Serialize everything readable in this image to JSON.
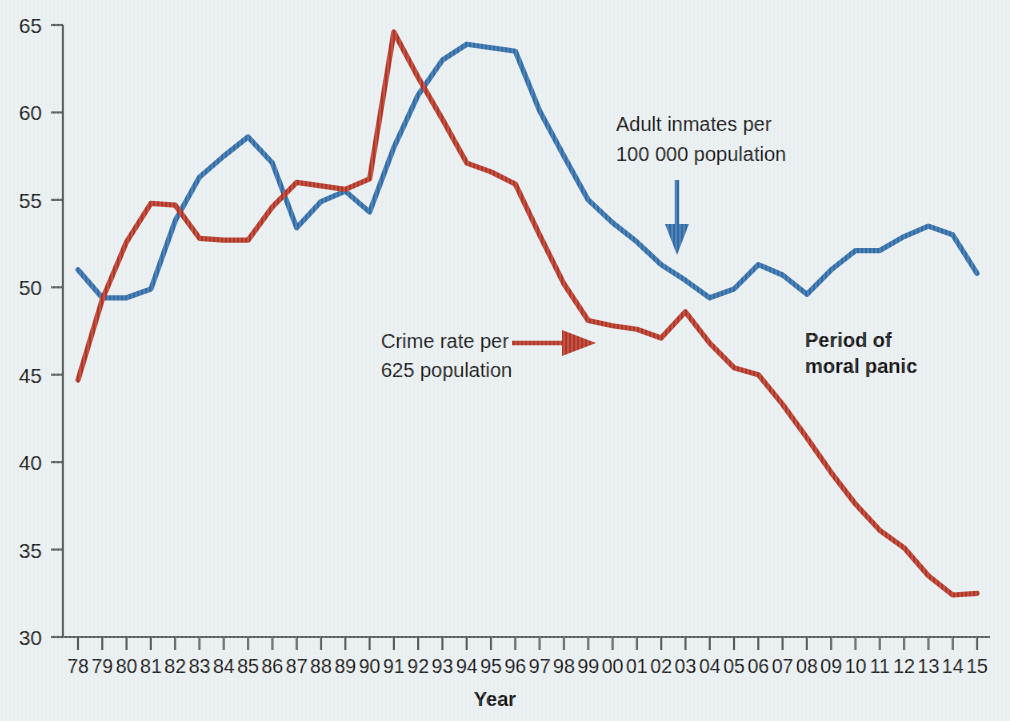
{
  "chart_data": {
    "type": "line",
    "title": "",
    "xlabel": "Year",
    "ylabel": "",
    "ylim": [
      30,
      65
    ],
    "yticks": [
      30,
      35,
      40,
      45,
      50,
      55,
      60,
      65
    ],
    "grid": false,
    "legend_position": "inline-annotations",
    "categories": [
      "78",
      "79",
      "80",
      "81",
      "82",
      "83",
      "84",
      "85",
      "86",
      "87",
      "88",
      "89",
      "90",
      "91",
      "92",
      "93",
      "94",
      "95",
      "96",
      "97",
      "98",
      "99",
      "00",
      "01",
      "02",
      "03",
      "04",
      "05",
      "06",
      "07",
      "08",
      "09",
      "10",
      "11",
      "12",
      "13",
      "14",
      "15"
    ],
    "series": [
      {
        "name": "Adult inmates per 100 000 population",
        "color": "#2f6ca8",
        "values": [
          51.0,
          49.4,
          49.4,
          49.9,
          53.8,
          56.3,
          57.5,
          58.6,
          57.1,
          53.4,
          54.9,
          55.5,
          54.3,
          58.0,
          61.0,
          63.0,
          63.9,
          63.7,
          63.5,
          60.1,
          57.5,
          55.0,
          53.7,
          52.6,
          51.3,
          50.4,
          49.4,
          49.9,
          51.3,
          50.7,
          49.6,
          51.0,
          52.1,
          52.1,
          52.9,
          53.5,
          53.0,
          50.8
        ]
      },
      {
        "name": "Crime rate per 625 population",
        "color": "#b33424",
        "values": [
          44.7,
          49.3,
          52.6,
          54.8,
          54.7,
          52.8,
          52.7,
          52.7,
          54.6,
          56.0,
          55.8,
          55.6,
          56.2,
          64.6,
          62.0,
          59.6,
          57.1,
          56.6,
          55.9,
          53.0,
          50.2,
          48.1,
          47.8,
          47.6,
          47.1,
          48.6,
          46.8,
          45.4,
          45.0,
          43.3,
          41.4,
          39.4,
          37.6,
          36.1,
          35.1,
          33.5,
          32.4,
          32.5
        ]
      }
    ],
    "annotations": [
      {
        "name": "inmates-annotation",
        "line1": "Adult inmates per",
        "line2": "100 000 population",
        "color": "#2f6ca8",
        "arrow": "down-arrow"
      },
      {
        "name": "crime-rate-annotation",
        "line1": "Crime rate per",
        "line2": "625 population",
        "color": "#b33424",
        "arrow": "right-arrow"
      },
      {
        "name": "moral-panic-label",
        "line1": "Period of",
        "line2": "moral panic",
        "color": "#111111",
        "arrow": "none"
      }
    ]
  },
  "colors": {
    "background": "#e9eef0",
    "blue_series": "#2f6ca8",
    "red_series": "#b33424",
    "axis": "#555b5e",
    "text": "#1b1b1b"
  }
}
